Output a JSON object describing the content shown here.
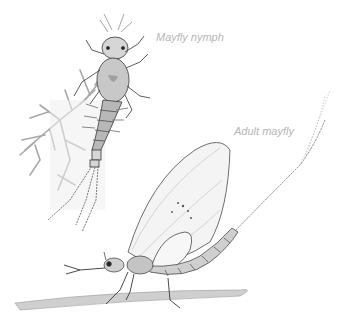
{
  "illustration": {
    "labels": {
      "nymph": "Mayfly nymph",
      "adult": "Adult mayfly"
    },
    "subjects": [
      "mayfly-nymph",
      "adult-mayfly",
      "water-plant",
      "grass-stem"
    ],
    "colors": {
      "background": "#ffffff",
      "label": "#b5b5b5",
      "ink": "#4a4a4a",
      "plant": "#a8a8a8",
      "wing": "#f4f4f4"
    }
  }
}
